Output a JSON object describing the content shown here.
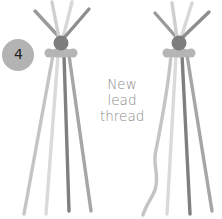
{
  "step": {
    "number": "4",
    "badge_color": "#b3b3b3"
  },
  "caption": {
    "lines": [
      "New",
      "lead",
      "thread"
    ],
    "color": "#8a8a8a"
  },
  "colors": {
    "thread_light": "#d6d6d6",
    "thread_mid": "#bcbcbc",
    "thread_dark": "#8c8c8c",
    "thread_darker": "#7a7a7a",
    "knot": "#7d7d7d",
    "knot_band": "#b0b0b0"
  },
  "figures": [
    {
      "name": "before",
      "label": "braid-before-new-lead"
    },
    {
      "name": "after",
      "label": "braid-with-new-lead-thread"
    }
  ]
}
